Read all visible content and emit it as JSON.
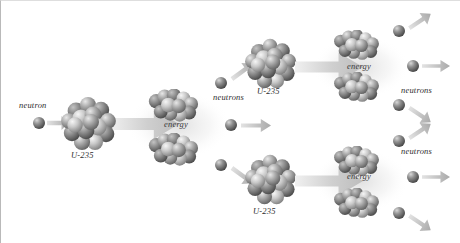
{
  "figure": {
    "background_color": "#ffffff",
    "label_color": "#2e2e2e",
    "nucleus_color": "#8a8a8a",
    "neutron_color": "#6e6e6e",
    "arrow_color": "#c9c9c9"
  },
  "labels": {
    "incoming_neutron": "neutron",
    "u235_gen1": "U-235",
    "energy_gen1": "energy",
    "neutrons_gen1": "neutrons",
    "u235_gen2_top": "U-235",
    "u235_gen2_bottom": "U-235",
    "energy_gen2_top": "energy",
    "energy_gen2_bottom": "energy",
    "neutrons_gen2_top": "neutrons",
    "neutrons_gen2_bottom": "neutrons"
  },
  "diagram_data": {
    "type": "process-diagram",
    "subject": "nuclear fission chain reaction",
    "generations": 3,
    "stages": [
      {
        "stage": 1,
        "incident_particles": 1,
        "target": "U-235",
        "products": [
          "fission fragment",
          "fission fragment",
          "energy"
        ],
        "neutrons_released": 3
      },
      {
        "stage": 2,
        "incident_particles": 2,
        "targets": [
          "U-235",
          "U-235"
        ],
        "products": [
          "fission fragment",
          "fission fragment",
          "energy"
        ],
        "neutrons_released": 6
      }
    ],
    "nuclei": [
      {
        "name": "u235-gen1",
        "cx": 88,
        "cy": 122,
        "r": 26,
        "label": "U-235",
        "label_x": 88,
        "label_y": 154
      },
      {
        "name": "u235-gen2-top",
        "cx": 270,
        "cy": 62,
        "r": 24,
        "label": "U-235",
        "label_x": 272,
        "label_y": 92
      },
      {
        "name": "u235-gen2-bottom",
        "cx": 270,
        "cy": 178,
        "r": 24,
        "label": "U-235",
        "label_x": 272,
        "label_y": 210
      }
    ],
    "fragments": [
      {
        "name": "fragment-gen1-top",
        "cx": 172,
        "cy": 104,
        "rx": 25,
        "ry": 16
      },
      {
        "name": "fragment-gen1-bottom",
        "cx": 172,
        "cy": 148,
        "rx": 25,
        "ry": 16
      },
      {
        "name": "fragment-gen2-top-upper",
        "cx": 355,
        "cy": 44,
        "rx": 23,
        "ry": 15
      },
      {
        "name": "fragment-gen2-top-lower",
        "cx": 355,
        "cy": 86,
        "rx": 23,
        "ry": 15
      },
      {
        "name": "fragment-gen2-bottom-upper",
        "cx": 355,
        "cy": 160,
        "rx": 23,
        "ry": 15
      },
      {
        "name": "fragment-gen2-bottom-lower",
        "cx": 355,
        "cy": 202,
        "rx": 23,
        "ry": 15
      }
    ],
    "neutrons": [
      {
        "name": "neutron-incident",
        "cx": 38,
        "cy": 122,
        "r": 6
      },
      {
        "name": "neutron-gen1-up",
        "cx": 220,
        "cy": 82,
        "r": 6
      },
      {
        "name": "neutron-gen1-mid",
        "cx": 230,
        "cy": 124,
        "r": 6
      },
      {
        "name": "neutron-gen1-down",
        "cx": 220,
        "cy": 164,
        "r": 6
      },
      {
        "name": "neutron-gen2-top-up",
        "cx": 398,
        "cy": 30,
        "r": 6
      },
      {
        "name": "neutron-gen2-top-mid",
        "cx": 412,
        "cy": 65,
        "r": 6
      },
      {
        "name": "neutron-gen2-top-down",
        "cx": 398,
        "cy": 104,
        "r": 6
      },
      {
        "name": "neutron-gen2-bot-up",
        "cx": 398,
        "cy": 140,
        "r": 6
      },
      {
        "name": "neutron-gen2-bot-mid",
        "cx": 412,
        "cy": 176,
        "r": 6
      },
      {
        "name": "neutron-gen2-bot-down",
        "cx": 398,
        "cy": 212,
        "r": 6
      }
    ],
    "label_positions": [
      {
        "key": "incoming_neutron",
        "x": 18,
        "y": 100
      },
      {
        "key": "u235_gen1",
        "x": 70,
        "y": 150
      },
      {
        "key": "energy_gen1",
        "x": 163,
        "y": 119
      },
      {
        "key": "neutrons_gen1",
        "x": 212,
        "y": 92
      },
      {
        "key": "u235_gen2_top",
        "x": 256,
        "y": 86
      },
      {
        "key": "u235_gen2_bottom",
        "x": 252,
        "y": 206
      },
      {
        "key": "energy_gen2_top",
        "x": 346,
        "y": 61
      },
      {
        "key": "energy_gen2_bottom",
        "x": 346,
        "y": 171
      },
      {
        "key": "neutrons_gen2_top",
        "x": 400,
        "y": 85
      },
      {
        "key": "neutrons_gen2_bottom",
        "x": 400,
        "y": 146
      }
    ]
  }
}
